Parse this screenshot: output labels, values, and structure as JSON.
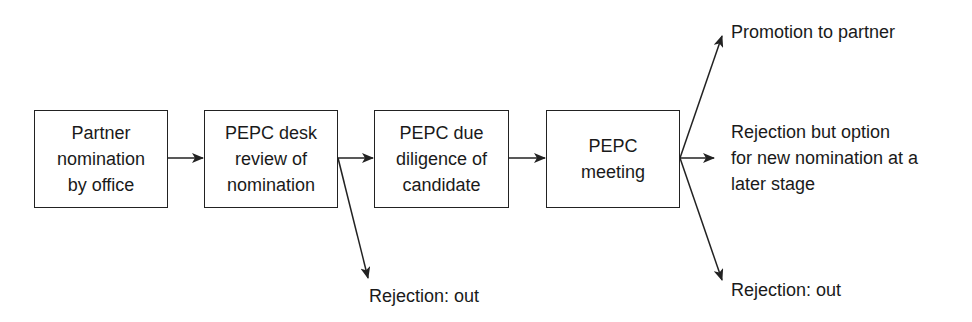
{
  "diagram": {
    "type": "flowchart",
    "boxes": [
      {
        "id": "b1",
        "label": "Partner\nnomination\nby office"
      },
      {
        "id": "b2",
        "label": "PEPC desk\nreview of\nnomination"
      },
      {
        "id": "b3",
        "label": "PEPC due\ndiligence of\ncandidate"
      },
      {
        "id": "b4",
        "label": "PEPC\nmeeting"
      }
    ],
    "outcomes": {
      "desk_rejection": "Rejection: out",
      "promotion": "Promotion to partner",
      "rejection_option": "Rejection but option\nfor new nomination at a\nlater stage",
      "final_rejection": "Rejection: out"
    },
    "edges": [
      {
        "from": "b1",
        "to": "b2"
      },
      {
        "from": "b2",
        "to": "b3"
      },
      {
        "from": "b2",
        "to": "desk_rejection"
      },
      {
        "from": "b3",
        "to": "b4"
      },
      {
        "from": "b4",
        "to": "promotion"
      },
      {
        "from": "b4",
        "to": "rejection_option"
      },
      {
        "from": "b4",
        "to": "final_rejection"
      }
    ]
  }
}
